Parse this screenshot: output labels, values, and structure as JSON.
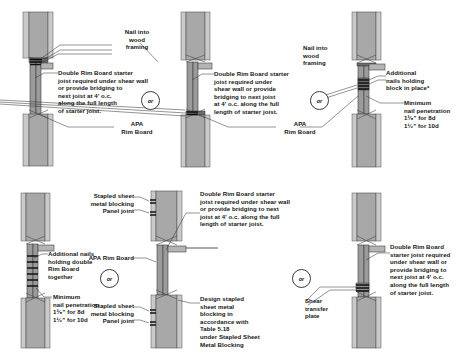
{
  "figure": {
    "or_label": "or",
    "colors": {
      "wall_fill": "#a8a8a8",
      "sheathing_fill": "#c9c9c9",
      "rim_fill": "#9b9b9b",
      "line": "#3a3a3a",
      "text": "#161616",
      "background": "#ffffff"
    }
  },
  "panels": [
    {
      "id": "top-left",
      "callouts": [
        {
          "name": "nail-into-wood-framing",
          "text": "Nail into\nwood\nframing"
        },
        {
          "name": "double-rim-board-starter-joist",
          "text": "Double Rim Board starter\njoist required under shear wall\nor provide bridging to\nnext joist at 4' o.c.\nalong the full length\nof starter joist."
        },
        {
          "name": "apa-rim-board",
          "text": "APA\nRim Board"
        }
      ]
    },
    {
      "id": "top-center",
      "callouts": [
        {
          "name": "double-rim-board-starter-joist",
          "text": "Double Rim Board starter\njoist required under\nshear wall or provide\nbridging to next joist\nat 4' o.c. along the full\nlength of starter joist."
        },
        {
          "name": "apa-rim-board",
          "text": "APA\nRim Board"
        }
      ]
    },
    {
      "id": "top-right",
      "callouts": [
        {
          "name": "nail-into-wood-framing",
          "text": "Nail into\nwood\nframing"
        },
        {
          "name": "additional-nails-holding-block",
          "text": "Additional\nnails holding\nblock in place*"
        },
        {
          "name": "minimum-nail-penetration",
          "text": "Minimum\nnail penetration"
        },
        {
          "name": "penetration-8d",
          "text": "1³⁄₈\" for 8d"
        },
        {
          "name": "penetration-10d",
          "text": "1¹⁄₂\" for 10d"
        }
      ]
    },
    {
      "id": "bottom-left",
      "callouts": [
        {
          "name": "additional-nails-holding-double-rim-board",
          "text": "Additional nails\nholding double\nRim Board\ntogether"
        },
        {
          "name": "minimum-nail-penetration",
          "text": "Minimum\nnail penetration"
        },
        {
          "name": "penetration-8d",
          "text": "1³⁄₈\" for 8d"
        },
        {
          "name": "penetration-10d",
          "text": "1¹⁄₂\" for 10d"
        }
      ]
    },
    {
      "id": "bottom-center",
      "callouts": [
        {
          "name": "stapled-sheet-metal-blocking-upper",
          "text": "Stapled sheet\nmetal blocking"
        },
        {
          "name": "panel-joint-upper",
          "text": "Panel joint"
        },
        {
          "name": "apa-rim-board",
          "text": "APA Rim Board"
        },
        {
          "name": "stapled-sheet-metal-blocking-lower",
          "text": "Stapled sheet\nmetal blocking"
        },
        {
          "name": "panel-joint-lower",
          "text": "Panel joint"
        },
        {
          "name": "double-rim-board-starter-joist",
          "text": "Double Rim Board starter\njoist required under shear wall\nor provide bridging to next\njoist at 4' o.c. along the full\nlength of starter joist."
        },
        {
          "name": "design-stapled-sheet-metal-blocking",
          "text": "Design stapled\nsheet metal\nblocking in\naccordance with\nTable 5.18\nunder Stapled Sheet\nMetal Blocking"
        }
      ]
    },
    {
      "id": "bottom-right",
      "callouts": [
        {
          "name": "shear-transfer-plate",
          "text": "Shear\ntransfer\nplate"
        },
        {
          "name": "double-rim-board-starter-joist",
          "text": "Double Rim Board\nstarter joist required\nunder shear wall or\nprovide bridging to\nnext joist at 4' o.c.\nalong the full length\nof starter joist."
        }
      ]
    }
  ],
  "or_bubbles": [
    {
      "name": "or-bubble-top-1"
    },
    {
      "name": "or-bubble-top-2"
    },
    {
      "name": "or-bubble-bottom-1"
    },
    {
      "name": "or-bubble-bottom-2"
    }
  ]
}
